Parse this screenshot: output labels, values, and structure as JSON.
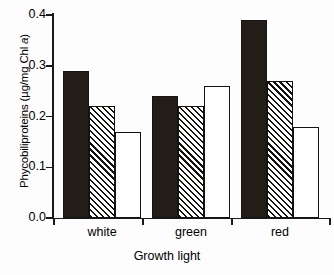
{
  "chart_data": {
    "type": "bar",
    "title": "",
    "xlabel": "Growth light",
    "ylabel": "Phycobiliproteins (µg/mg Chl a)",
    "ylabel_parts": {
      "lead": "Phycobiliproteins (µg/mg Chl ",
      "italic": "a",
      "tail": ")"
    },
    "categories": [
      "white",
      "green",
      "red"
    ],
    "series": [
      {
        "name": "solid-black",
        "fill": "solid",
        "values": [
          0.29,
          0.24,
          0.39
        ]
      },
      {
        "name": "hatched",
        "fill": "hatched",
        "values": [
          0.22,
          0.22,
          0.27
        ]
      },
      {
        "name": "open-white",
        "fill": "open",
        "values": [
          0.17,
          0.26,
          0.18
        ]
      }
    ],
    "ylim": [
      0.0,
      0.4
    ],
    "ytick_values": [
      0.0,
      0.1,
      0.2,
      0.3,
      0.4
    ],
    "ytick_labels": [
      "0.0",
      "0.1",
      "0.2",
      "0.3",
      "0.4"
    ],
    "grid": false,
    "legend": "none",
    "legend_position": "none",
    "colors": {
      "solid": "#231d18",
      "hatch_line": "#15120f",
      "open": "#ffffff",
      "axis": "#1a1a1a",
      "background": "#fdfdfd"
    }
  }
}
